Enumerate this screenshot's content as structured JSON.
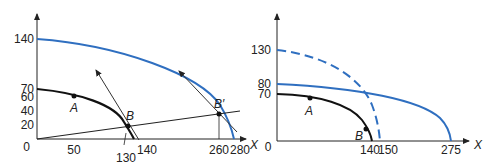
{
  "colors": {
    "black_curve": "#111111",
    "blue_curve": "#2f6fc0",
    "axis": "#222222"
  },
  "left_panel": {
    "y_ticks": [
      "140",
      "70",
      "60",
      "40",
      "20",
      "0"
    ],
    "x_ticks": [
      "50",
      "130",
      "140",
      "260",
      "280"
    ],
    "x_axis_label": "X",
    "points": {
      "A": "A",
      "B": "B",
      "B_prime": "B′"
    }
  },
  "right_panel": {
    "y_ticks": [
      "130",
      "80",
      "70",
      "0"
    ],
    "x_ticks": [
      "140",
      "150",
      "275"
    ],
    "x_axis_label": "X",
    "left_axis_label": "X",
    "points": {
      "A": "A",
      "B": "B"
    }
  }
}
